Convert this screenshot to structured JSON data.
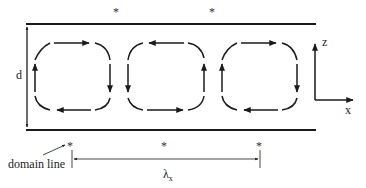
{
  "diagram": {
    "type": "convection-rolls",
    "labels": {
      "depth": "d",
      "wavelength": "λ",
      "wavelength_subscript": "x",
      "domain_line": "domain line",
      "axis_z": "z",
      "axis_x": "x",
      "star": "*"
    },
    "boundaries": {
      "top_wall_y": 24,
      "bottom_wall_y": 130,
      "x_start": 27,
      "x_end": 316
    },
    "top_markers": [
      {
        "x": 117,
        "label": "*"
      },
      {
        "x": 213,
        "label": "*"
      }
    ],
    "bottom_markers": [
      {
        "x": 71,
        "label": "*"
      },
      {
        "x": 165,
        "label": "*"
      },
      {
        "x": 260,
        "label": "*"
      }
    ],
    "cells": [
      {
        "id": 1,
        "rotation": "clockwise"
      },
      {
        "id": 2,
        "rotation": "counter-clockwise"
      },
      {
        "id": 3,
        "rotation": "clockwise"
      }
    ],
    "colors": {
      "line": "#1a1a1a",
      "text": "#222222"
    }
  }
}
